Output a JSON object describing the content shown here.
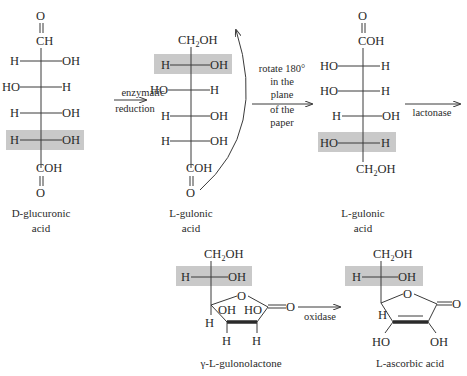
{
  "colors": {
    "highlight": "#c9c9c9",
    "ink": "#2a2a2a",
    "background": "#ffffff"
  },
  "structures": {
    "d_glucuronic": {
      "top": "CH",
      "top_o": "O",
      "rows": [
        {
          "left": "H",
          "right": "OH"
        },
        {
          "left": "HO",
          "right": "H"
        },
        {
          "left": "H",
          "right": "OH"
        },
        {
          "left": "H",
          "right": "OH",
          "highlighted": true
        }
      ],
      "bottom": "COH",
      "bottom_o": "O",
      "caption": [
        "D-glucuronic",
        "acid"
      ]
    },
    "l_gulonic_1": {
      "top": "CH2OH",
      "rows": [
        {
          "left": "H",
          "right": "OH",
          "highlighted": true
        },
        {
          "left": "HO",
          "right": "H"
        },
        {
          "left": "H",
          "right": "OH"
        },
        {
          "left": "H",
          "right": "OH"
        }
      ],
      "bottom": "COH",
      "bottom_o": "O",
      "caption": [
        "L-gulonic",
        "acid"
      ]
    },
    "l_gulonic_2": {
      "top": "COH",
      "top_o": "O",
      "rows": [
        {
          "left": "HO",
          "right": "H"
        },
        {
          "left": "HO",
          "right": "H"
        },
        {
          "left": "H",
          "right": "OH"
        },
        {
          "left": "HO",
          "right": "H",
          "highlighted": true
        }
      ],
      "bottom": "CH2OH",
      "caption": [
        "L-gulonic",
        "acid"
      ]
    },
    "gulonolactone": {
      "top": "CH2OH",
      "side": {
        "left": "H",
        "right": "OH",
        "highlighted": true
      },
      "ring": {
        "o": "O",
        "carbonyl_o": "O",
        "oh_left": "OH",
        "oh_right": "HO",
        "h_c4": "H",
        "h_c3": "H",
        "h_c2": "H"
      },
      "caption": "γ-L-gulonolactone"
    },
    "ascorbic": {
      "top": "CH2OH",
      "side": {
        "left": "H",
        "right": "OH",
        "highlighted": true
      },
      "ring": {
        "o": "O",
        "carbonyl_o": "O",
        "h_c4": "H",
        "oh_left": "HO",
        "oh_right": "OH"
      },
      "caption": "L-ascorbic acid"
    }
  },
  "arrows": {
    "enzymatic": {
      "line1": "enzymatic",
      "line2": "reduction"
    },
    "rotate": {
      "lines": [
        "rotate 180°",
        "in the",
        "plane",
        "of the",
        "paper"
      ]
    },
    "lactonase": {
      "label": "lactonase"
    },
    "oxidase": {
      "label": "oxidase"
    }
  }
}
